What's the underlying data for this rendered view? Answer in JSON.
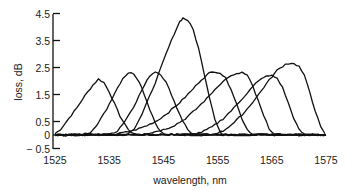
{
  "chart_data": {
    "type": "line",
    "title": "",
    "xlabel": "wavelength, nm",
    "ylabel": "loss, dB",
    "xlim": [
      1525,
      1575
    ],
    "ylim": [
      -0.5,
      4.5
    ],
    "x_ticks": [
      1525,
      1535,
      1545,
      1555,
      1565,
      1575
    ],
    "x_tick_labels": [
      "1525",
      "1535",
      "1545",
      "1555",
      "1565",
      "1575"
    ],
    "y_ticks": [
      4.5,
      3.5,
      2.5,
      1.5,
      0.5,
      0,
      -0.5
    ],
    "y_tick_labels": [
      "4.5",
      "3.5",
      "2.5",
      "1.5",
      "0.5",
      "0",
      "− 0.5"
    ],
    "grid": false,
    "legend": null,
    "series": [
      {
        "name": "filter 1",
        "peak_wavelength": 1533.0,
        "peak_loss": 2.07,
        "points": [
          [
            1525,
            0.05
          ],
          [
            1526,
            0.2
          ],
          [
            1527.5,
            0.6
          ],
          [
            1529,
            1.0
          ],
          [
            1530.5,
            1.45
          ],
          [
            1532,
            1.85
          ],
          [
            1533,
            2.07
          ],
          [
            1534,
            1.95
          ],
          [
            1535,
            1.6
          ],
          [
            1536,
            1.15
          ],
          [
            1537,
            0.7
          ],
          [
            1538,
            0.35
          ],
          [
            1539,
            0.1
          ],
          [
            1540,
            0.02
          ],
          [
            1575,
            0.0
          ]
        ]
      },
      {
        "name": "filter 2",
        "peak_wavelength": 1538.5,
        "peak_loss": 2.3,
        "points": [
          [
            1525,
            0.0
          ],
          [
            1530,
            0.02
          ],
          [
            1531.5,
            0.1
          ],
          [
            1533,
            0.45
          ],
          [
            1534.5,
            0.95
          ],
          [
            1536,
            1.55
          ],
          [
            1537.5,
            2.1
          ],
          [
            1538.5,
            2.3
          ],
          [
            1539.5,
            2.28
          ],
          [
            1540.5,
            2.0
          ],
          [
            1541.5,
            1.5
          ],
          [
            1542.5,
            0.95
          ],
          [
            1543.5,
            0.45
          ],
          [
            1544.5,
            0.12
          ],
          [
            1545.5,
            0.0
          ],
          [
            1575,
            0.0
          ]
        ]
      },
      {
        "name": "filter 3",
        "peak_wavelength": 1543.5,
        "peak_loss": 2.35,
        "points": [
          [
            1525,
            0.0
          ],
          [
            1535,
            0.02
          ],
          [
            1536.5,
            0.15
          ],
          [
            1538,
            0.55
          ],
          [
            1539.5,
            1.05
          ],
          [
            1541,
            1.65
          ],
          [
            1542.5,
            2.2
          ],
          [
            1543.5,
            2.35
          ],
          [
            1544.5,
            2.25
          ],
          [
            1545.5,
            1.95
          ],
          [
            1546.5,
            1.5
          ],
          [
            1547.5,
            1.0
          ],
          [
            1548.5,
            0.55
          ],
          [
            1549.5,
            0.2
          ],
          [
            1550.5,
            0.02
          ],
          [
            1575,
            0.0
          ]
        ]
      },
      {
        "name": "filter 4",
        "peak_wavelength": 1548.6,
        "peak_loss": 4.33,
        "points": [
          [
            1525,
            0.0
          ],
          [
            1538,
            0.02
          ],
          [
            1539.5,
            0.2
          ],
          [
            1541,
            0.75
          ],
          [
            1542.5,
            1.45
          ],
          [
            1544,
            2.2
          ],
          [
            1545.5,
            3.0
          ],
          [
            1547,
            3.75
          ],
          [
            1548,
            4.2
          ],
          [
            1548.6,
            4.33
          ],
          [
            1549.5,
            4.25
          ],
          [
            1550.5,
            3.9
          ],
          [
            1551.5,
            3.2
          ],
          [
            1552.5,
            2.3
          ],
          [
            1553.5,
            1.4
          ],
          [
            1554.5,
            0.6
          ],
          [
            1555.5,
            0.1
          ],
          [
            1556,
            0.0
          ],
          [
            1575,
            0.0
          ]
        ]
      },
      {
        "name": "filter 5",
        "peak_wavelength": 1554.5,
        "peak_loss": 2.35,
        "points": [
          [
            1525,
            0.0
          ],
          [
            1536,
            0.02
          ],
          [
            1538,
            0.1
          ],
          [
            1540,
            0.2
          ],
          [
            1542,
            0.35
          ],
          [
            1544,
            0.55
          ],
          [
            1546,
            0.85
          ],
          [
            1548,
            1.2
          ],
          [
            1550,
            1.6
          ],
          [
            1552,
            2.05
          ],
          [
            1553.5,
            2.3
          ],
          [
            1554.5,
            2.35
          ],
          [
            1555.5,
            2.3
          ],
          [
            1556.5,
            2.1
          ],
          [
            1557.5,
            1.7
          ],
          [
            1558.5,
            1.15
          ],
          [
            1559.5,
            0.6
          ],
          [
            1560.5,
            0.2
          ],
          [
            1561.5,
            0.02
          ],
          [
            1575,
            0.0
          ]
        ]
      },
      {
        "name": "filter 6",
        "peak_wavelength": 1559.5,
        "peak_loss": 2.3,
        "points": [
          [
            1525,
            0.0
          ],
          [
            1541,
            0.02
          ],
          [
            1543,
            0.1
          ],
          [
            1545,
            0.2
          ],
          [
            1547,
            0.35
          ],
          [
            1549,
            0.6
          ],
          [
            1551,
            0.95
          ],
          [
            1553,
            1.35
          ],
          [
            1555,
            1.8
          ],
          [
            1557,
            2.15
          ],
          [
            1558.5,
            2.25
          ],
          [
            1559.5,
            2.32
          ],
          [
            1560.5,
            2.2
          ],
          [
            1561.5,
            1.8
          ],
          [
            1562.5,
            1.25
          ],
          [
            1563.5,
            0.7
          ],
          [
            1564.5,
            0.25
          ],
          [
            1565.5,
            0.02
          ],
          [
            1575,
            0.0
          ]
        ]
      },
      {
        "name": "filter 7",
        "peak_wavelength": 1565.0,
        "peak_loss": 2.2,
        "points": [
          [
            1525,
            0.0
          ],
          [
            1550,
            0.02
          ],
          [
            1552,
            0.1
          ],
          [
            1554,
            0.3
          ],
          [
            1556,
            0.6
          ],
          [
            1558,
            1.0
          ],
          [
            1560,
            1.45
          ],
          [
            1562,
            1.9
          ],
          [
            1563.5,
            2.15
          ],
          [
            1565,
            2.2
          ],
          [
            1566,
            2.1
          ],
          [
            1567,
            1.75
          ],
          [
            1568,
            1.2
          ],
          [
            1569,
            0.65
          ],
          [
            1570,
            0.2
          ],
          [
            1571,
            0.02
          ],
          [
            1575,
            0.0
          ]
        ]
      },
      {
        "name": "filter 8",
        "peak_wavelength": 1568.7,
        "peak_loss": 2.67,
        "points": [
          [
            1525,
            0.0
          ],
          [
            1554,
            0.02
          ],
          [
            1556,
            0.15
          ],
          [
            1558,
            0.45
          ],
          [
            1560,
            0.85
          ],
          [
            1562,
            1.35
          ],
          [
            1564,
            1.9
          ],
          [
            1566,
            2.4
          ],
          [
            1567.5,
            2.62
          ],
          [
            1568.7,
            2.67
          ],
          [
            1570,
            2.55
          ],
          [
            1571,
            2.2
          ],
          [
            1572,
            1.6
          ],
          [
            1573,
            0.9
          ],
          [
            1574,
            0.3
          ],
          [
            1574.8,
            0.05
          ]
        ]
      }
    ]
  }
}
